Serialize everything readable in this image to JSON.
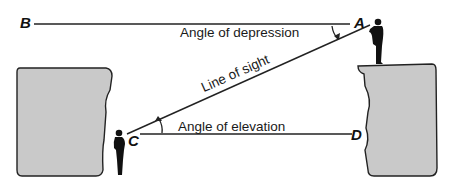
{
  "points": {
    "B": "B",
    "A": "A",
    "C": "C",
    "D": "D"
  },
  "labels": {
    "depression": "Angle of depression",
    "line_of_sight": "Line of sight",
    "elevation": "Angle of elevation"
  },
  "colors": {
    "cliff_fill": "#c9c9c9",
    "line": "#222222",
    "background": "#ffffff"
  }
}
